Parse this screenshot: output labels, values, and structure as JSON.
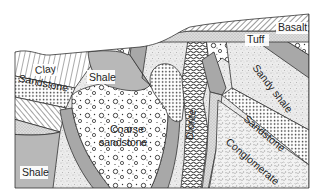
{
  "diagram": {
    "type": "geological-cross-section",
    "background": "#ffffff",
    "colors": {
      "shale_fill": "#b5b5b5",
      "dike_gray": "#a6a6a6",
      "tuff_fill": "#d8d8d8",
      "outline": "#333333",
      "pattern_ink": "#444444"
    },
    "units": [
      {
        "id": "basalt",
        "label": "Basalt",
        "pattern": "diagonal-hatch"
      },
      {
        "id": "tuff",
        "label": "Tuff",
        "pattern": "fine-stipple"
      },
      {
        "id": "clay",
        "label": "Clay",
        "pattern": "vertical-lines"
      },
      {
        "id": "sandstone_left",
        "label": "Sandstone",
        "pattern": "dots"
      },
      {
        "id": "shale_upper",
        "label": "Shale",
        "pattern": "solid-gray"
      },
      {
        "id": "coarse_sandstone",
        "label": "Coarse sandstone",
        "label_lines": [
          "Coarse",
          "sandstone"
        ],
        "pattern": "pebbles"
      },
      {
        "id": "diorite",
        "label": "Diorite",
        "pattern": "squiggle"
      },
      {
        "id": "sandy_shale",
        "label": "Sandy shale",
        "pattern": "speckle"
      },
      {
        "id": "sandstone_right",
        "label": "Sandstone",
        "pattern": "dots"
      },
      {
        "id": "conglomerate",
        "label": "Conglomerate",
        "pattern": "worm-texture"
      },
      {
        "id": "shale_lower",
        "label": "Shale",
        "pattern": "solid-gray"
      }
    ],
    "labels": {
      "basalt": "Basalt",
      "tuff": "Tuff",
      "clay": "Clay",
      "sandstone_left": "Sandstone",
      "shale_upper": "Shale",
      "coarse_line1": "Coarse",
      "coarse_line2": "sandstone",
      "diorite": "Diorite",
      "sandy_shale": "Sandy shale",
      "sandstone_right": "Sandstone",
      "conglomerate": "Conglomerate",
      "shale_lower": "Shale"
    }
  }
}
